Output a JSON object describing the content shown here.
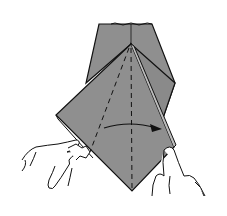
{
  "diagram": {
    "colors": {
      "paper": "#8f8f8f",
      "paper_edge": "#b8b8b8",
      "line": "#111111",
      "background": "#ffffff"
    },
    "annotations": {
      "arrow": "fold direction: left to right",
      "dashed_lines": "valley fold / center crease lines"
    }
  }
}
